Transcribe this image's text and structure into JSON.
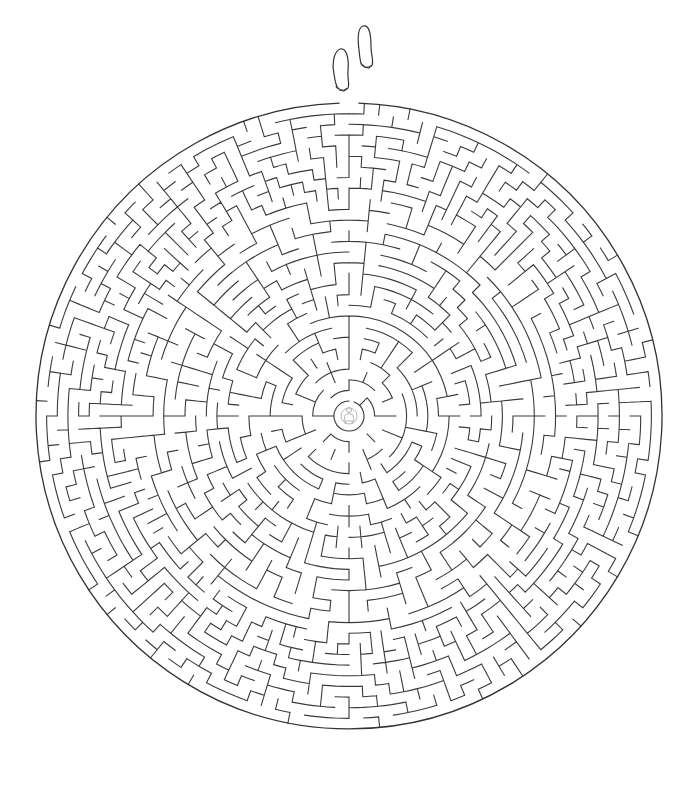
{
  "page": {
    "title_cropped": "",
    "background": "#ffffff",
    "ink_color": "#3a3a3a"
  },
  "maze": {
    "shape": "circle",
    "center": [
      349,
      416
    ],
    "radius": 313,
    "inner_radius": 9,
    "rings": 28,
    "base_sectors": 8,
    "entrance_angle_deg": -90,
    "entrance_label": "footprints-entrance",
    "goal_label": "center-figure",
    "seed": 20240517
  },
  "icons": {
    "entrance": "footprints-icon",
    "goal": "person-figure-icon"
  }
}
